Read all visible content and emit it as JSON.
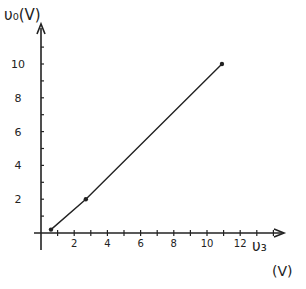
{
  "chart_data": {
    "type": "line",
    "title": "",
    "xlabel": "v_S",
    "xunit": "(V)",
    "ylabel": "v_O(V)",
    "x_ticks": [
      2,
      4,
      6,
      8,
      10,
      12
    ],
    "y_ticks": [
      2,
      4,
      6,
      8,
      10
    ],
    "xlim": [
      0,
      14
    ],
    "ylim": [
      0,
      11
    ],
    "grid": false,
    "legend": null,
    "series": [
      {
        "name": "v_O vs v_S",
        "x": [
          0.6,
          2.7,
          10.9
        ],
        "y": [
          0.2,
          2.0,
          10.0
        ],
        "markers": true
      }
    ]
  },
  "labels": {
    "y_axis": "υ₀(V)",
    "x_axis": "υ₃",
    "x_unit": "(V)",
    "x_tick_labels": [
      "2",
      "4",
      "6",
      "8",
      "10",
      "12"
    ],
    "y_tick_labels": [
      "2",
      "4",
      "6",
      "8",
      "10"
    ]
  },
  "colors": {
    "ink": "#222222",
    "background": "#ffffff"
  }
}
